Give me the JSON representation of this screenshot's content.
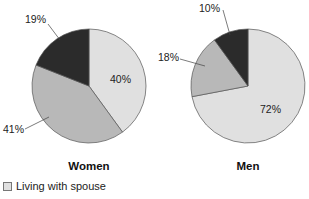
{
  "chart_data": [
    {
      "type": "pie",
      "title": "Women",
      "start_angle_deg": 0,
      "direction": "clockwise",
      "slices": [
        {
          "label": "Living with spouse",
          "value": 40,
          "display": "40%",
          "color": "#e0e0e0"
        },
        {
          "label": "",
          "value": 41,
          "display": "41%",
          "color": "#b8b8b8"
        },
        {
          "label": "",
          "value": 19,
          "display": "19%",
          "color": "#2b2b2b"
        }
      ]
    },
    {
      "type": "pie",
      "title": "Men",
      "start_angle_deg": 0,
      "direction": "clockwise",
      "slices": [
        {
          "label": "Living with spouse",
          "value": 72,
          "display": "72%",
          "color": "#e0e0e0"
        },
        {
          "label": "",
          "value": 18,
          "display": "18%",
          "color": "#b8b8b8"
        },
        {
          "label": "",
          "value": 10,
          "display": "10%",
          "color": "#2b2b2b"
        }
      ]
    }
  ],
  "legend": {
    "items": [
      {
        "label": "Living with spouse",
        "color": "#e0e0e0"
      }
    ]
  }
}
